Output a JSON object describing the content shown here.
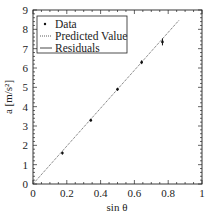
{
  "chart_data": {
    "type": "scatter",
    "title": "",
    "xlabel": "sin θ",
    "ylabel": "a [m/s²]",
    "xlim": [
      0,
      1
    ],
    "ylim": [
      0,
      9
    ],
    "xticks": [
      "0",
      "0.2",
      "0.4",
      "0.6",
      "0.8",
      "1"
    ],
    "yticks": [
      "0",
      "1",
      "2",
      "3",
      "4",
      "5",
      "6",
      "7",
      "8",
      "9"
    ],
    "grid": false,
    "legend_position": "upper left",
    "legend": [
      "Data",
      "Predicted Value",
      "Residuals"
    ],
    "series": [
      {
        "name": "Data",
        "style": "points with error bars",
        "x": [
          0.174,
          0.342,
          0.5,
          0.643,
          0.766
        ],
        "y": [
          1.6,
          3.3,
          4.9,
          6.3,
          7.35
        ],
        "yerr": [
          0.08,
          0.08,
          0.08,
          0.1,
          0.18
        ]
      },
      {
        "name": "Predicted Value",
        "style": "dotted line",
        "x": [
          0,
          0.866
        ],
        "y": [
          0,
          8.49
        ]
      },
      {
        "name": "Residuals",
        "style": "solid line",
        "x": [],
        "y": []
      }
    ]
  },
  "colors": {
    "axis": "#222222",
    "data": "#111111",
    "line": "#333333"
  }
}
